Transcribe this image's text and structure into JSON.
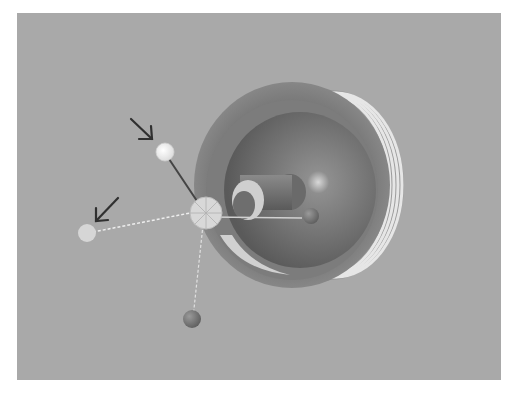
{
  "scene": {
    "background_color": "#a9a9a9",
    "page_color": "#ffffff",
    "description": "Grayscale 3D render of a cup/bowl-shaped object with ribbed outer rim, containing a sphere and a rod, with a gizmo of three axes ending in spheres; two arrows point at two of the end spheres",
    "object": {
      "outer_shell_color": "#8a8a8a",
      "inner_bowl_color": "#6e6e6e",
      "sphere_color": "#7a7a7a",
      "ring_color": "#cfcfcf",
      "rib_count": 4
    },
    "gizmo": {
      "pivot_color": "#d6d6d6",
      "axes": [
        {
          "name": "upper-axis",
          "style": "solid",
          "end_sphere_color": "#f0f0f0"
        },
        {
          "name": "left-axis",
          "style": "dashed",
          "end_sphere_color": "#d8d8d8"
        },
        {
          "name": "lower-axis",
          "style": "dashed",
          "end_sphere_color": "#6a6a6a"
        },
        {
          "name": "right-axis",
          "style": "solid",
          "end_sphere_color": "#8a8a8a"
        }
      ]
    },
    "arrows": [
      {
        "target": "upper-axis-end-sphere",
        "color": "#333333"
      },
      {
        "target": "left-axis-end-sphere",
        "color": "#333333"
      }
    ]
  }
}
